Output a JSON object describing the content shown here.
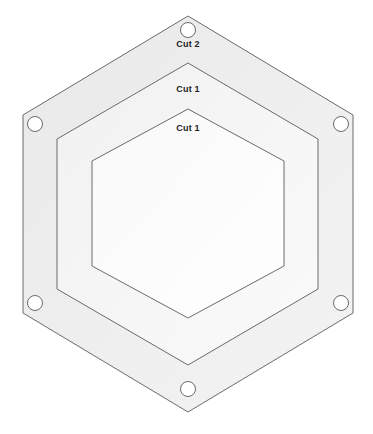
{
  "diagram": {
    "background_color": "#ffffff",
    "stroke_color": "#6a6a6a",
    "stroke_width": 1,
    "label_color": "#1d1d1d",
    "label_font_size": 9,
    "canvas": {
      "width": 373,
      "height": 434
    },
    "center": {
      "x": 188,
      "y": 214
    },
    "rings": [
      {
        "name": "outer-hexagon",
        "label": "Cut 2",
        "fill_color": "#eeeeee",
        "vertices": [
          {
            "x": 188,
            "y": 16
          },
          {
            "x": 353,
            "y": 115
          },
          {
            "x": 353,
            "y": 313
          },
          {
            "x": 188,
            "y": 412
          },
          {
            "x": 23,
            "y": 313
          },
          {
            "x": 23,
            "y": 115
          }
        ]
      },
      {
        "name": "middle-hexagon",
        "label": "Cut 1",
        "fill_color": "#f4f4f4",
        "vertices": [
          {
            "x": 188,
            "y": 63
          },
          {
            "x": 318,
            "y": 139
          },
          {
            "x": 318,
            "y": 289
          },
          {
            "x": 188,
            "y": 365
          },
          {
            "x": 57,
            "y": 289
          },
          {
            "x": 57,
            "y": 139
          }
        ]
      },
      {
        "name": "inner-hexagon",
        "label": "Cut 1",
        "fill_color": "#fbfbfb",
        "vertices": [
          {
            "x": 188,
            "y": 109
          },
          {
            "x": 284,
            "y": 161
          },
          {
            "x": 284,
            "y": 266
          },
          {
            "x": 188,
            "y": 318
          },
          {
            "x": 92,
            "y": 266
          },
          {
            "x": 92,
            "y": 161
          }
        ]
      }
    ],
    "holes": [
      {
        "name": "hole-top",
        "cx": 188,
        "cy": 30,
        "r": 7.5
      },
      {
        "name": "hole-top-right",
        "cx": 341,
        "cy": 124,
        "r": 7.5
      },
      {
        "name": "hole-bottom-right",
        "cx": 341,
        "cy": 303,
        "r": 7.5
      },
      {
        "name": "hole-bottom",
        "cx": 188,
        "cy": 389,
        "r": 7.5
      },
      {
        "name": "hole-bottom-left",
        "cx": 35,
        "cy": 303,
        "r": 7.5
      },
      {
        "name": "hole-top-left",
        "cx": 35,
        "cy": 124,
        "r": 7.5
      }
    ],
    "labels": [
      {
        "name": "cut-2-label",
        "text": "Cut 2",
        "x": 188,
        "y": 39
      },
      {
        "name": "cut-1-outer-label",
        "text": "Cut 1",
        "x": 188,
        "y": 84
      },
      {
        "name": "cut-1-inner-label",
        "text": "Cut 1",
        "x": 188,
        "y": 123
      }
    ]
  }
}
